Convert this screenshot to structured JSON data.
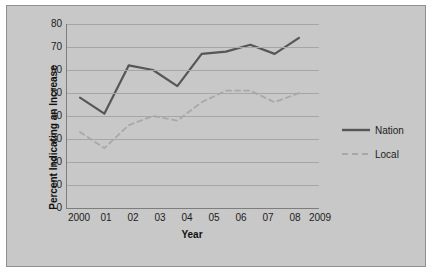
{
  "chart_data": {
    "type": "line",
    "title": "",
    "xlabel": "Year",
    "ylabel": "Percent Indicating an Increase",
    "categories": [
      "2000",
      "01",
      "02",
      "03",
      "04",
      "05",
      "06",
      "07",
      "08",
      "2009"
    ],
    "x": [
      2000,
      2001,
      2002,
      2003,
      2004,
      2005,
      2006,
      2007,
      2008,
      2009
    ],
    "series": [
      {
        "name": "Nation",
        "style": "solid",
        "color": "#565656",
        "values": [
          48,
          41,
          62,
          60,
          53,
          67,
          68,
          71,
          67,
          74
        ]
      },
      {
        "name": "Local",
        "style": "dashed",
        "color": "#a8a8a8",
        "values": [
          33,
          26,
          36,
          40,
          38,
          46,
          51,
          51,
          46,
          50
        ]
      }
    ],
    "ylim": [
      0,
      80
    ],
    "yticks": [
      0,
      10,
      20,
      30,
      40,
      50,
      60,
      70,
      80
    ],
    "grid": true,
    "legend_position": "right"
  },
  "axis": {
    "y_tick_labels": [
      "80",
      "70",
      "60",
      "50",
      "40",
      "30",
      "20",
      "10",
      "0"
    ],
    "x_tick_labels": [
      "2000",
      "01",
      "02",
      "03",
      "04",
      "05",
      "06",
      "07",
      "08",
      "2009"
    ],
    "x_axis_title": "Year",
    "y_axis_title": "Percent Indicating an Increase"
  },
  "legend": {
    "items": [
      {
        "label": "Nation"
      },
      {
        "label": "Local"
      }
    ]
  },
  "colors": {
    "plot_background": "#c8c8c8",
    "frame_border": "#8f8f8f",
    "gridline": "#a6a6a6",
    "axis_line": "#7d7d7d",
    "nation_line": "#565656",
    "local_line": "#a8a8a8",
    "text": "#1c1c1c"
  }
}
